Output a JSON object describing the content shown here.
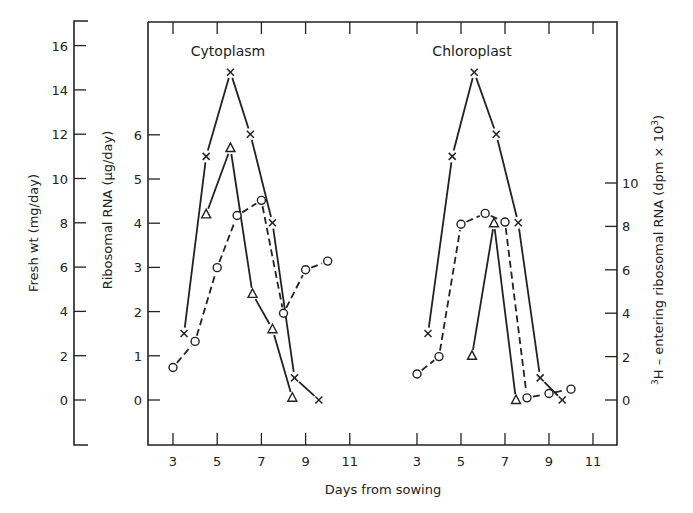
{
  "chart_data": {
    "type": "line",
    "title": "",
    "xlabel": "Days from sowing",
    "panels": [
      {
        "name": "Cytoplasm",
        "x_ticks": [
          3,
          5,
          7,
          9,
          11
        ],
        "series": [
          {
            "name": "Fresh wt (mg/day)",
            "marker": "cross",
            "line": "solid",
            "axis": "fresh_wt",
            "x": [
              3.5,
              4.5,
              5.6,
              6.5,
              7.5,
              8.5,
              9.6
            ],
            "y": [
              3,
              11,
              14.8,
              12,
              8,
              1,
              0
            ]
          },
          {
            "name": "Ribosomal RNA (µg/day)",
            "marker": "triangle",
            "line": "solid",
            "axis": "ribosomal_rna",
            "x": [
              4.5,
              5.6,
              6.6,
              7.5,
              8.4
            ],
            "y": [
              4.2,
              5.7,
              2.4,
              1.6,
              0.05
            ]
          },
          {
            "name": "3H - entering ribosomal RNA (dpm x 10^3)",
            "marker": "circle",
            "line": "dashed",
            "axis": "h3",
            "x": [
              3.0,
              4.0,
              5.0,
              5.9,
              7.0,
              8.0,
              9.0,
              10.0
            ],
            "y": [
              1.5,
              2.7,
              6.1,
              8.5,
              9.2,
              4.0,
              6.0,
              6.4
            ]
          }
        ]
      },
      {
        "name": "Chloroplast",
        "x_ticks": [
          3,
          5,
          7,
          9,
          11
        ],
        "series": [
          {
            "name": "Fresh wt (mg/day)",
            "marker": "cross",
            "line": "solid",
            "axis": "fresh_wt",
            "x": [
              3.5,
              4.6,
              5.6,
              6.6,
              7.6,
              8.6,
              9.6
            ],
            "y": [
              3,
              11,
              14.8,
              12,
              8,
              1,
              0
            ]
          },
          {
            "name": "Ribosomal RNA (µg/day)",
            "marker": "triangle",
            "line": "solid",
            "axis": "ribosomal_rna",
            "x": [
              5.5,
              6.5,
              7.5
            ],
            "y": [
              1.0,
              4.0,
              0
            ]
          },
          {
            "name": "3H - entering ribosomal RNA (dpm x 10^3)",
            "marker": "circle",
            "line": "dashed",
            "axis": "h3",
            "x": [
              3.0,
              4.0,
              5.0,
              6.1,
              7.0,
              8.0,
              9.0,
              10.0
            ],
            "y": [
              1.2,
              2.0,
              8.1,
              8.6,
              8.2,
              0.1,
              0.3,
              0.5
            ]
          }
        ]
      }
    ],
    "axes": {
      "fresh_wt": {
        "label": "Fresh wt (mg/day)",
        "ticks": [
          0,
          2,
          4,
          6,
          8,
          10,
          12,
          14,
          16
        ],
        "ylim": [
          -2.5,
          17.5
        ],
        "position": "far-left"
      },
      "ribosomal_rna": {
        "label": "Ribosomal RNA (µg/day)",
        "ticks": [
          0,
          1,
          2,
          3,
          4,
          5,
          6
        ],
        "ylim": [
          -1.0,
          8.8
        ],
        "position": "left"
      },
      "h3": {
        "label": "³H - entering ribosomal RNA (dpm × 10³)",
        "ticks": [
          0,
          2,
          4,
          6,
          8,
          10
        ],
        "ylim": [
          -2.0,
          17.6
        ],
        "position": "right"
      }
    },
    "grid": false,
    "legend": "none (series identified by markers)"
  },
  "labels": {
    "panel_left": "Cytoplasm",
    "panel_right": "Chloroplast",
    "xlabel": "Days from sowing",
    "y_fresh": "Fresh wt (mg/day)",
    "y_rna": "Ribosomal RNA (µg/day)",
    "y_h3_prefix": "3",
    "y_h3_main": "H – entering ribosomal RNA (dpm × 10",
    "y_h3_sup": "3",
    "y_h3_close": ")"
  }
}
